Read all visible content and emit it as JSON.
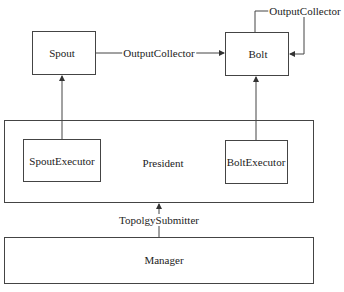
{
  "diagram": {
    "nodes": {
      "spout": "Spout",
      "bolt": "Bolt",
      "president": "President",
      "spout_executor": "SpoutExecutor",
      "bolt_executor": "BoltExecutor",
      "manager": "Manager"
    },
    "edges": {
      "spout_to_bolt": "OutputCollector",
      "bolt_self_loop": "OutputCollector",
      "manager_to_president": "TopolgySubmitter"
    },
    "colors": {
      "line": "#444444",
      "background": "#ffffff"
    }
  }
}
